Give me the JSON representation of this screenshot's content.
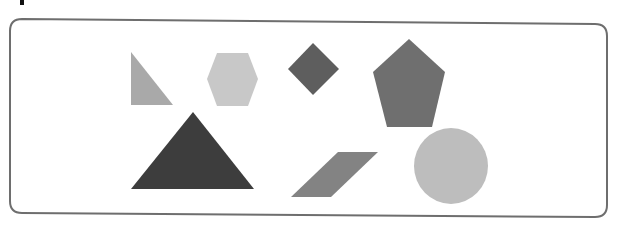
{
  "figure": {
    "title": "",
    "frame": {
      "stroke": "#6e6e6e",
      "fill": "#ffffff",
      "radius": 12
    },
    "shapes": [
      {
        "id": "right-triangle",
        "kind": "right-triangle",
        "row": 1,
        "color": "#a9a9a9",
        "points": "131,52 131,105 173,105"
      },
      {
        "id": "hexagon",
        "kind": "hexagon",
        "row": 1,
        "color": "#c8c8c8",
        "points": "217,53 248,53 258,79 248,106 217,106 207,79"
      },
      {
        "id": "diamond",
        "kind": "rhombus",
        "row": 1,
        "color": "#5e5e5e",
        "points": "313,43 339,69 313,95 288,69"
      },
      {
        "id": "pentagon",
        "kind": "pentagon",
        "row": 1,
        "color": "#6f6f6f",
        "points": "409,39 445,72 432,127 387,127 373,72"
      },
      {
        "id": "large-triangle",
        "kind": "triangle",
        "row": 2,
        "color": "#3d3d3d",
        "points": "193,112 254,189 131,189"
      },
      {
        "id": "parallelogram",
        "kind": "parallelogram",
        "row": 2,
        "color": "#838383",
        "points": "338,152 378,152 331,197 291,197"
      },
      {
        "id": "circle",
        "kind": "circle",
        "row": 2,
        "color": "#bdbdbd",
        "cx": 451,
        "cy": 166,
        "rx": 37,
        "ry": 38
      }
    ]
  }
}
